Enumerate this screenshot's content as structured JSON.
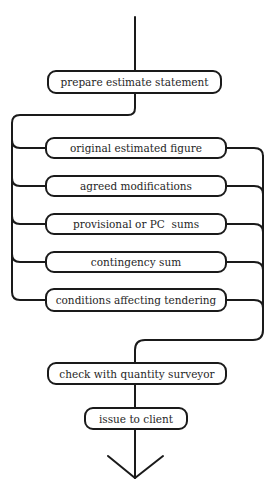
{
  "flowchart": {
    "start": {
      "label": "prepare estimate statement"
    },
    "components": [
      {
        "label": "original estimated figure"
      },
      {
        "label": "agreed modifications"
      },
      {
        "label": "provisional or PC  sums"
      },
      {
        "label": "contingency sum"
      },
      {
        "label": "conditions affecting tendering"
      }
    ],
    "check": {
      "label": "check with quantity surveyor"
    },
    "end": {
      "label": "issue to client"
    },
    "line_color": "#1a1a1a",
    "box_border_color": "#1a1a1a",
    "background_color": "#ffffff"
  }
}
